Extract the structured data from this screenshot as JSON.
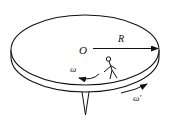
{
  "diagram": {
    "labels": {
      "center": "O",
      "radius": "R",
      "person_angular_velocity": "ω",
      "disk_angular_velocity": "ω'"
    },
    "colors": {
      "stroke": "#111111",
      "background": "#ffffff"
    }
  }
}
